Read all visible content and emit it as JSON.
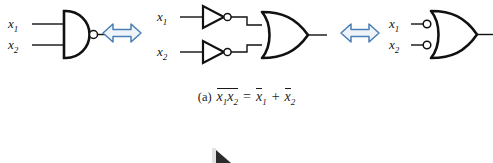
{
  "figure": {
    "caption_label": "(a)",
    "equation_left_terms": [
      "x",
      "1",
      "x",
      "2"
    ],
    "equation_operator": "=",
    "equation_right": "x̄1 + x̄2",
    "equation_plain": "(a) NOT(x1 x2) = NOT x1 + NOT x2",
    "overbar_note": "overbar spans x1x2 on left side; separate overbars on each x on right side"
  },
  "variables": {
    "x_symbol": "x",
    "sub_1": "1",
    "sub_2": "2",
    "plus": "+",
    "equals": "="
  },
  "stage1": {
    "name": "nand-gate-stage",
    "gate_label": "NAND",
    "inputs": [
      {
        "label_symbol": "x",
        "label_sub": "1"
      },
      {
        "label_symbol": "x",
        "label_sub": "2"
      }
    ],
    "output_bubble": true
  },
  "equivalence_arrows": [
    {
      "name": "equivalence-arrow-1",
      "symbol": "⟺",
      "color": "#5b8fc9"
    },
    {
      "name": "equivalence-arrow-2",
      "symbol": "⟺",
      "color": "#5b8fc9"
    }
  ],
  "stage2": {
    "name": "inverters-or-gate-stage",
    "gate_label": "OR",
    "inverters": [
      {
        "label_symbol": "x",
        "label_sub": "1",
        "bubble": true
      },
      {
        "label_symbol": "x",
        "label_sub": "2",
        "bubble": true
      }
    ]
  },
  "stage3": {
    "name": "negated-input-or-gate-stage",
    "gate_label": "OR",
    "inputs": [
      {
        "label_symbol": "x",
        "label_sub": "1",
        "bubble": true
      },
      {
        "label_symbol": "x",
        "label_sub": "2",
        "bubble": true
      }
    ]
  },
  "partial_shape": {
    "name": "next-figure-partial-triangle",
    "visible": true
  },
  "colors": {
    "line": "#111111",
    "arrow_stroke": "#4a7fb5",
    "arrow_fill": "#e8f0f8",
    "background": "#ffffff",
    "text": "#1a1a1a"
  }
}
